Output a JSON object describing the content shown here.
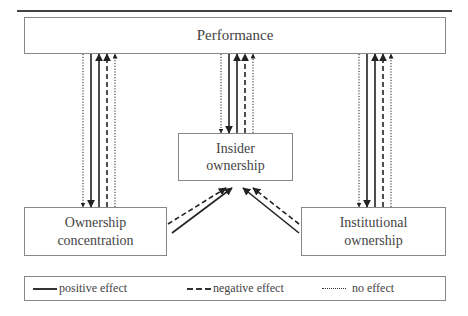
{
  "nodes": {
    "performance": "Performance",
    "insider_line1": "Insider",
    "insider_line2": "ownership",
    "ownership_line1": "Ownership",
    "ownership_line2": "concentration",
    "institutional_line1": "Institutional",
    "institutional_line2": "ownership"
  },
  "legend": {
    "positive": "positive effect",
    "negative": "negative effect",
    "none": "no effect"
  },
  "edges": [
    {
      "from": "Performance",
      "to": "Ownership concentration",
      "effect": "none"
    },
    {
      "from": "Performance",
      "to": "Ownership concentration",
      "effect": "positive"
    },
    {
      "from": "Ownership concentration",
      "to": "Performance",
      "effect": "positive"
    },
    {
      "from": "Ownership concentration",
      "to": "Performance",
      "effect": "negative"
    },
    {
      "from": "Ownership concentration",
      "to": "Performance",
      "effect": "none"
    },
    {
      "from": "Performance",
      "to": "Insider ownership",
      "effect": "none"
    },
    {
      "from": "Performance",
      "to": "Insider ownership",
      "effect": "positive"
    },
    {
      "from": "Insider ownership",
      "to": "Performance",
      "effect": "positive"
    },
    {
      "from": "Insider ownership",
      "to": "Performance",
      "effect": "negative"
    },
    {
      "from": "Insider ownership",
      "to": "Performance",
      "effect": "none"
    },
    {
      "from": "Performance",
      "to": "Institutional ownership",
      "effect": "none"
    },
    {
      "from": "Performance",
      "to": "Institutional ownership",
      "effect": "positive"
    },
    {
      "from": "Institutional ownership",
      "to": "Performance",
      "effect": "positive"
    },
    {
      "from": "Institutional ownership",
      "to": "Performance",
      "effect": "negative"
    },
    {
      "from": "Institutional ownership",
      "to": "Performance",
      "effect": "none"
    },
    {
      "from": "Ownership concentration",
      "to": "Insider ownership",
      "effect": "negative"
    },
    {
      "from": "Ownership concentration",
      "to": "Insider ownership",
      "effect": "positive"
    },
    {
      "from": "Institutional ownership",
      "to": "Insider ownership",
      "effect": "positive"
    },
    {
      "from": "Institutional ownership",
      "to": "Insider ownership",
      "effect": "negative"
    }
  ]
}
